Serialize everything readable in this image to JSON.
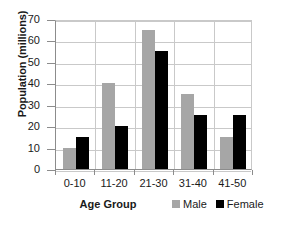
{
  "chart_data": {
    "type": "bar",
    "title": "",
    "xlabel": "Age Group",
    "ylabel": "Population (millions)",
    "categories": [
      "0-10",
      "11-20",
      "21-30",
      "31-40",
      "41-50"
    ],
    "series": [
      {
        "name": "Male",
        "color": "#a6a6a6",
        "values": [
          10,
          40,
          65,
          35,
          15
        ]
      },
      {
        "name": "Female",
        "color": "#000000",
        "values": [
          15,
          20,
          55,
          25,
          25
        ]
      }
    ],
    "ylim": [
      0,
      70
    ],
    "ytick_values": [
      0,
      10,
      20,
      30,
      40,
      50,
      60,
      70
    ],
    "ytick_labels": [
      "0",
      "10",
      "20",
      "30",
      "40",
      "50",
      "60",
      "70"
    ],
    "grid": "horizontal-and-category-separators",
    "legend_position": "bottom-right",
    "legend": [
      "Male",
      "Female"
    ]
  }
}
